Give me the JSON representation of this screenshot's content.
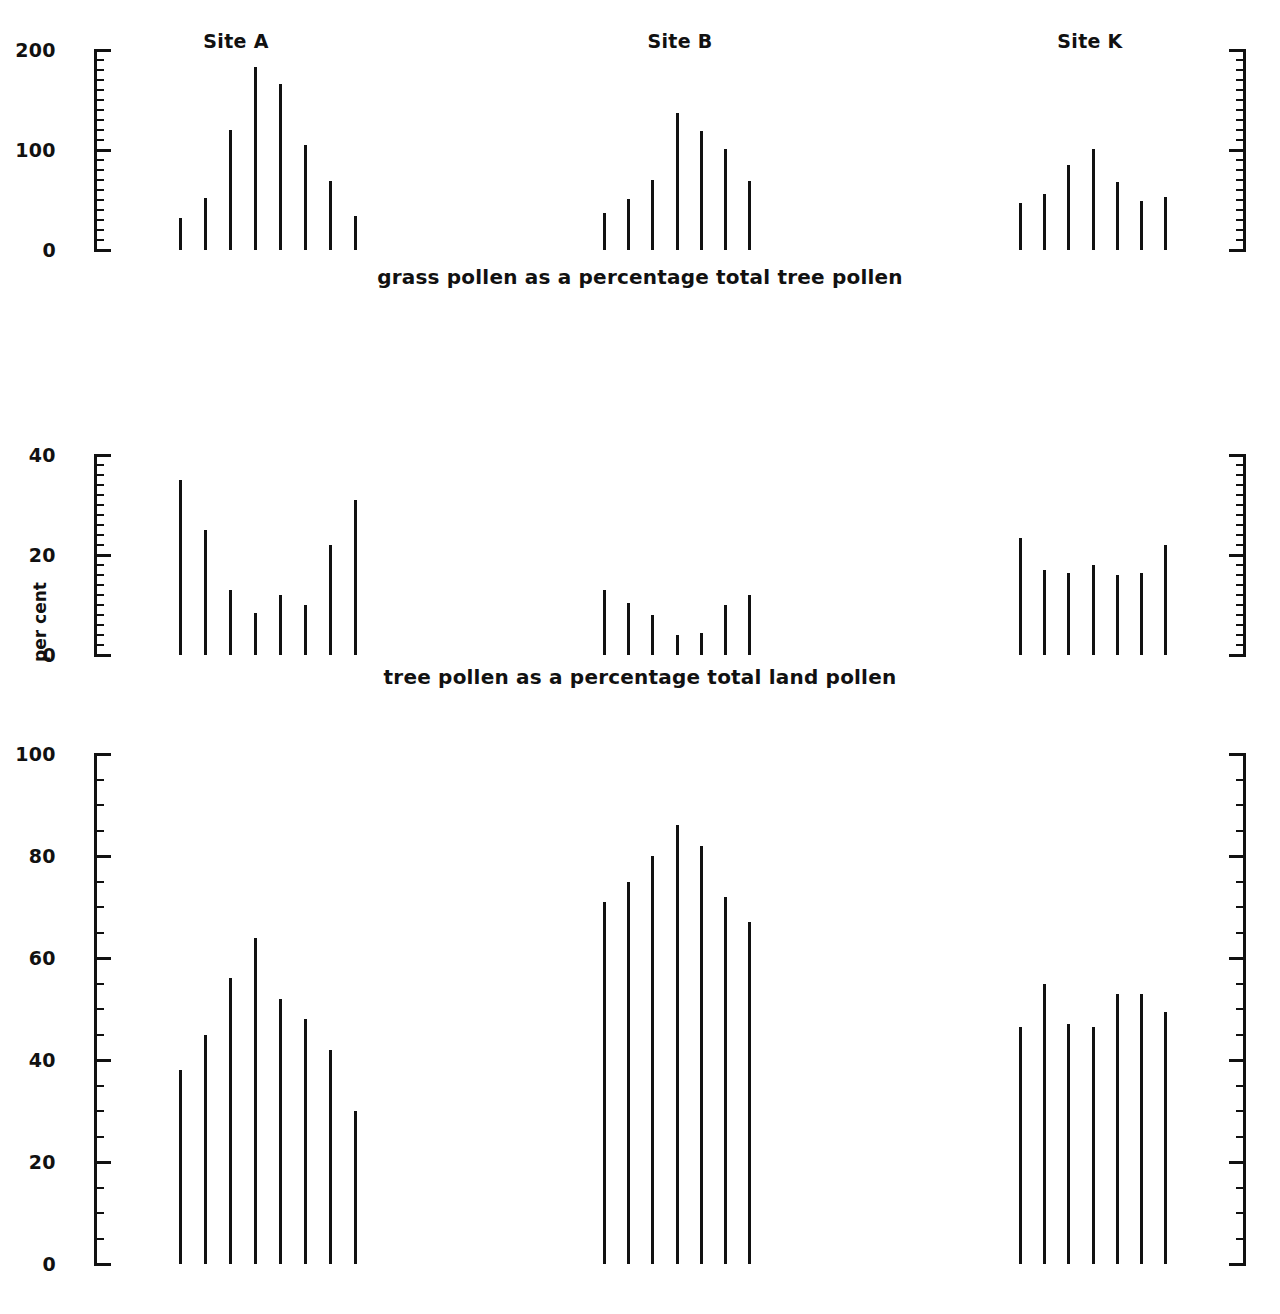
{
  "figure": {
    "ylabel": "per cent",
    "site_titles": [
      "Site A",
      "Site B",
      "Site K"
    ],
    "captions": [
      "grass pollen as a percentage total tree pollen",
      "tree pollen as a percentage total land pollen",
      "local pollen as a percentage total land pollen"
    ],
    "ink_color": "#111111",
    "background_color": "#ffffff"
  },
  "chart_data": [
    {
      "type": "bar",
      "title": "grass pollen as a percentage total tree pollen",
      "xlabel": "",
      "ylabel": "per cent",
      "ylim": [
        0,
        200
      ],
      "major_ticks": [
        0,
        100,
        200
      ],
      "tick_labels": [
        "0",
        "100",
        "200"
      ],
      "minor_tick_step": 10,
      "grid": false,
      "legend": "none",
      "series": [
        {
          "name": "Site A",
          "values": [
            32,
            52,
            120,
            183,
            166,
            105,
            69,
            34
          ]
        },
        {
          "name": "Site B",
          "values": [
            37,
            51,
            70,
            137,
            119,
            101,
            69
          ]
        },
        {
          "name": "Site K",
          "values": [
            47,
            56,
            85,
            101,
            68,
            49,
            53
          ]
        }
      ]
    },
    {
      "type": "bar",
      "title": "tree pollen as a percentage total land pollen",
      "xlabel": "",
      "ylabel": "per cent",
      "ylim": [
        0,
        40
      ],
      "major_ticks": [
        0,
        20,
        40
      ],
      "tick_labels": [
        "0",
        "20",
        "40"
      ],
      "minor_tick_step": 2,
      "grid": false,
      "legend": "none",
      "series": [
        {
          "name": "Site A",
          "values": [
            35,
            25,
            13,
            8.5,
            12,
            10,
            22,
            31
          ]
        },
        {
          "name": "Site B",
          "values": [
            13,
            10.5,
            8,
            4,
            4.5,
            10,
            12
          ]
        },
        {
          "name": "Site K",
          "values": [
            23.5,
            17,
            16.5,
            18,
            16,
            16.5,
            22
          ]
        }
      ]
    },
    {
      "type": "bar",
      "title": "local pollen as a percentage total land pollen",
      "xlabel": "",
      "ylabel": "per cent",
      "ylim": [
        0,
        100
      ],
      "major_ticks": [
        0,
        20,
        40,
        60,
        80,
        100
      ],
      "tick_labels": [
        "0",
        "20",
        "40",
        "60",
        "80",
        "100"
      ],
      "minor_tick_step": 5,
      "grid": false,
      "legend": "none",
      "series": [
        {
          "name": "Site A",
          "values": [
            38,
            45,
            56,
            64,
            52,
            48,
            42,
            30
          ]
        },
        {
          "name": "Site B",
          "values": [
            71,
            75,
            80,
            86,
            82,
            72,
            67
          ]
        },
        {
          "name": "Site K",
          "values": [
            46.5,
            55,
            47,
            46.5,
            53,
            53,
            49.5
          ]
        }
      ]
    }
  ]
}
